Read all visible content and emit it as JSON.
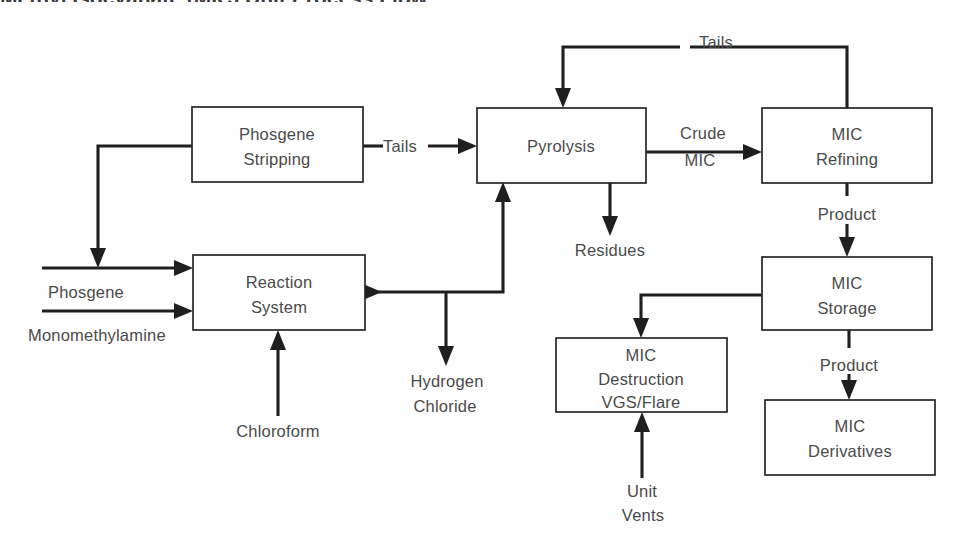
{
  "diagram": {
    "title": "Methyl Isocyanate (MIC) Unit Process Flow",
    "type": "process-flow-diagram",
    "background_color": "#fefefe",
    "line_color": "#1f1f1f",
    "text_color": "#4a4a4a",
    "boxes": [
      {
        "id": "phosgene-stripping",
        "label_line1": "Phosgene",
        "label_line2": "Stripping",
        "label_line3": "",
        "x": 192,
        "y": 107,
        "w": 171,
        "h": 75
      },
      {
        "id": "pyrolysis",
        "label_line1": "Pyrolysis",
        "label_line2": "",
        "label_line3": "",
        "x": 477,
        "y": 108,
        "w": 169,
        "h": 75
      },
      {
        "id": "mic-refining",
        "label_line1": "MIC",
        "label_line2": "Refining",
        "label_line3": "",
        "x": 762,
        "y": 108,
        "w": 170,
        "h": 75
      },
      {
        "id": "reaction-system",
        "label_line1": "Reaction",
        "label_line2": "System",
        "label_line3": "",
        "x": 193,
        "y": 255,
        "w": 172,
        "h": 75
      },
      {
        "id": "mic-storage",
        "label_line1": "MIC",
        "label_line2": "Storage",
        "label_line3": "",
        "x": 762,
        "y": 257,
        "w": 170,
        "h": 73
      },
      {
        "id": "mic-destruction",
        "label_line1": "MIC",
        "label_line2": "Destruction",
        "label_line3": "VGS/Flare",
        "x": 556,
        "y": 338,
        "w": 171,
        "h": 74
      },
      {
        "id": "mic-derivatives",
        "label_line1": "MIC",
        "label_line2": "Derivatives",
        "label_line3": "",
        "x": 765,
        "y": 400,
        "w": 170,
        "h": 75
      }
    ],
    "stream_labels": [
      {
        "id": "phosgene-feed",
        "text": "Phosgene",
        "x": 48,
        "y": 298,
        "anchor": "start"
      },
      {
        "id": "monomethylamine-feed",
        "text": "Monomethylamine",
        "x": 28,
        "y": 341,
        "anchor": "start"
      },
      {
        "id": "chloroform-feed",
        "text": "Chloroform",
        "x": 278,
        "y": 437,
        "anchor": "middle"
      },
      {
        "id": "tails-stripping",
        "text": "Tails",
        "x": 383,
        "y": 146,
        "anchor": "start"
      },
      {
        "id": "tails-recycle",
        "text": "Tails",
        "x": 716,
        "y": 48,
        "anchor": "middle"
      },
      {
        "id": "crude-mic-1",
        "text": "Crude",
        "x": 703,
        "y": 139,
        "anchor": "middle"
      },
      {
        "id": "crude-mic-2",
        "text": "MIC",
        "x": 700,
        "y": 166,
        "anchor": "middle"
      },
      {
        "id": "residues",
        "text": "Residues",
        "x": 610,
        "y": 256,
        "anchor": "middle"
      },
      {
        "id": "hydrogen-chloride-1",
        "text": "Hydrogen",
        "x": 447,
        "y": 387,
        "anchor": "middle"
      },
      {
        "id": "hydrogen-chloride-2",
        "text": "Chloride",
        "x": 445,
        "y": 412,
        "anchor": "middle"
      },
      {
        "id": "product-refining",
        "text": "Product",
        "x": 847,
        "y": 214,
        "anchor": "middle"
      },
      {
        "id": "product-storage",
        "text": "Product",
        "x": 849,
        "y": 365,
        "anchor": "middle"
      },
      {
        "id": "unit-vents-1",
        "text": "Unit",
        "x": 642,
        "y": 497,
        "anchor": "middle"
      },
      {
        "id": "unit-vents-2",
        "text": "Vents",
        "x": 643,
        "y": 521,
        "anchor": "middle"
      }
    ],
    "connections": [
      {
        "id": "phosgene-inlet",
        "from": "external",
        "to": "reaction-system",
        "label": "Phosgene"
      },
      {
        "id": "monomethylamine-inlet",
        "from": "external",
        "to": "reaction-system",
        "label": "Monomethylamine"
      },
      {
        "id": "chloroform-inlet",
        "from": "external",
        "to": "reaction-system",
        "label": "Chloroform"
      },
      {
        "id": "reaction-to-stripping",
        "from": "reaction-system",
        "to": "phosgene-stripping",
        "label": ""
      },
      {
        "id": "hydrogen-chloride-outlet",
        "from": "reaction-system",
        "to": "external",
        "label": "Hydrogen Chloride"
      },
      {
        "id": "phosgene-recycle",
        "from": "phosgene-stripping",
        "to": "phosgene-inlet",
        "label": ""
      },
      {
        "id": "stripping-to-pyrolysis",
        "from": "phosgene-stripping",
        "to": "pyrolysis",
        "label": "Tails"
      },
      {
        "id": "pyrolysis-to-refining",
        "from": "pyrolysis",
        "to": "mic-refining",
        "label": "Crude MIC"
      },
      {
        "id": "residues-outlet",
        "from": "pyrolysis",
        "to": "external",
        "label": "Residues"
      },
      {
        "id": "tails-recycle-loop",
        "from": "mic-refining",
        "to": "pyrolysis",
        "label": "Tails"
      },
      {
        "id": "refining-to-storage",
        "from": "mic-refining",
        "to": "mic-storage",
        "label": "Product"
      },
      {
        "id": "storage-to-destruction",
        "from": "mic-storage",
        "to": "mic-destruction",
        "label": ""
      },
      {
        "id": "storage-to-derivatives",
        "from": "mic-storage",
        "to": "mic-derivatives",
        "label": "Product"
      },
      {
        "id": "unit-vents-inlet",
        "from": "external",
        "to": "mic-destruction",
        "label": "Unit Vents"
      }
    ]
  }
}
